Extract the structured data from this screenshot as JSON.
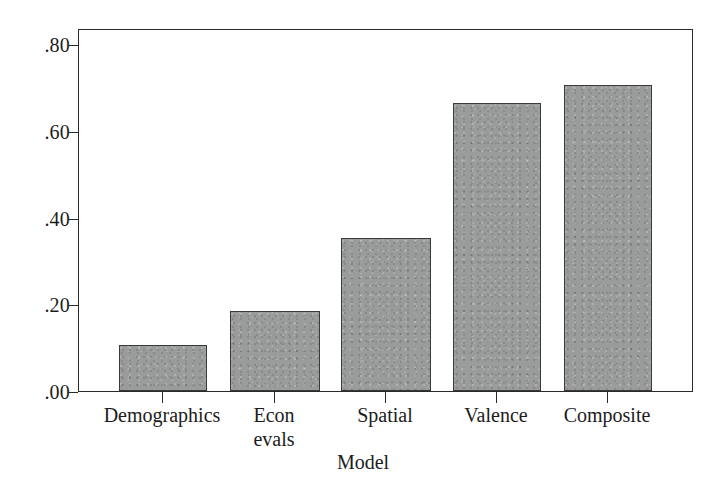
{
  "chart_data": {
    "type": "bar",
    "title": "",
    "xlabel": "Model",
    "ylabel": "",
    "categories": [
      "Demographics",
      "Econ\nevals",
      "Spatial",
      "Valence",
      "Composite"
    ],
    "values": [
      0.105,
      0.185,
      0.353,
      0.665,
      0.705
    ],
    "ylim": [
      0.0,
      0.84
    ],
    "yticks": [
      0.0,
      0.2,
      0.4,
      0.6,
      0.8
    ],
    "ytick_labels": [
      ".00",
      ".20",
      ".40",
      ".60",
      ".80"
    ],
    "grid": false,
    "legend": null,
    "bar_color": "#9a9c9b",
    "bar_edge_color": "#3a3a3a",
    "axis_color": "#2a2a2a",
    "background": "#ffffff"
  },
  "axes": {
    "x_title": "Model",
    "y_title": ""
  }
}
